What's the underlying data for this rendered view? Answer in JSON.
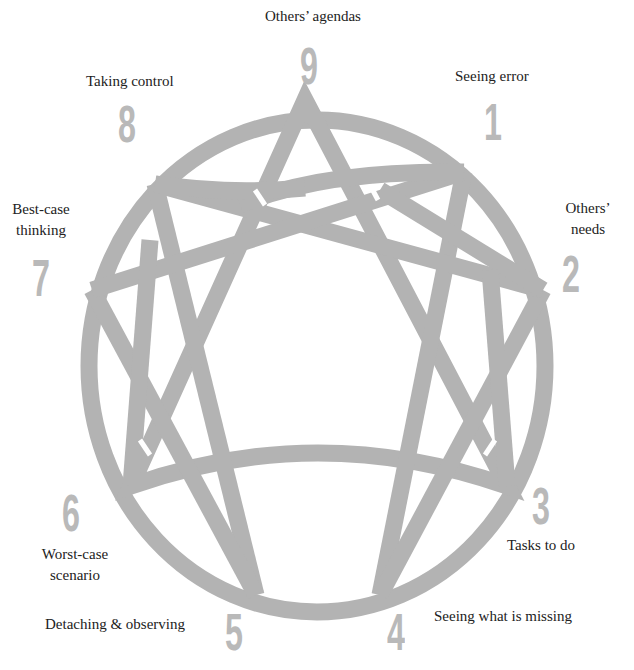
{
  "diagram": {
    "type": "enneagram",
    "stroke_color": "#b3b3b3",
    "number_color": "#b9b9b9",
    "text_color": "#222222",
    "points": [
      {
        "number": "9",
        "label": "Others’ agendas"
      },
      {
        "number": "1",
        "label": "Seeing error"
      },
      {
        "number": "2",
        "label_line1": "Others’",
        "label_line2": "needs"
      },
      {
        "number": "3",
        "label": "Tasks to do"
      },
      {
        "number": "4",
        "label": "Seeing what is missing"
      },
      {
        "number": "5",
        "label": "Detaching & observing"
      },
      {
        "number": "6",
        "label_line1": "Worst-case",
        "label_line2": "scenario"
      },
      {
        "number": "7",
        "label_line1": "Best-case",
        "label_line2": "thinking"
      },
      {
        "number": "8",
        "label": "Taking control"
      }
    ]
  }
}
